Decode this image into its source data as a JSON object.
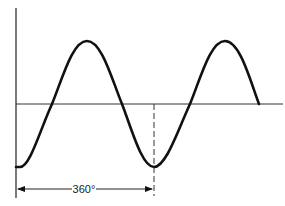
{
  "diagram": {
    "type": "sine-wave",
    "label_period": "360°",
    "colors": {
      "stroke": "#111111",
      "background": "#ffffff"
    },
    "curve": {
      "start_phase": "minimum",
      "cycles_shown": 1.75,
      "period_marker": "one full cycle from first minimum to second minimum"
    }
  }
}
